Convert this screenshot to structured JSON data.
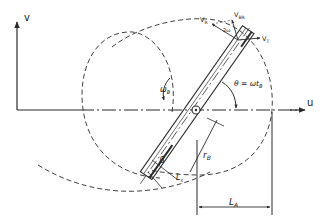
{
  "diagram": {
    "colors": {
      "line": "#2b2b2b",
      "background": "#ffffff"
    },
    "axes": {
      "v_label": "v",
      "u_label": "u"
    },
    "labels": {
      "omega_b": "ω",
      "omega_b_sub": "B",
      "theta": "θ = ωt",
      "theta_sub": "B",
      "r_b": "r",
      "r_b_sub": "B",
      "beta": "β",
      "l_s": "L",
      "l_s_sub": "s",
      "l_a": "L",
      "l_a_sub": "A",
      "v_r": "V",
      "v_r_sub": "R",
      "v_rel": "V",
      "v_rel_sub": "BR",
      "v_t": "V",
      "v_t_sub": "T",
      "angle_label": "2ω"
    }
  }
}
